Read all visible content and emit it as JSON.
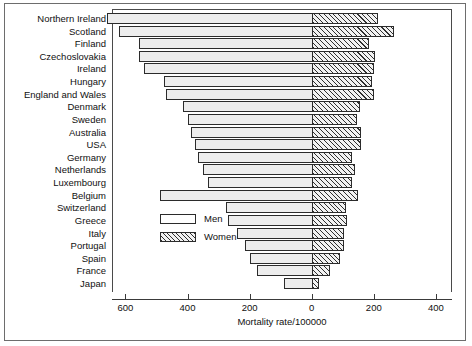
{
  "chart_data": {
    "type": "bar",
    "orientation": "horizontal",
    "style": "bidirectional-population-pyramid",
    "title": "",
    "xlabel": "Mortality rate/100000",
    "ylabel": "",
    "xlim": [
      -700,
      400
    ],
    "xticks": [
      600,
      400,
      200,
      0,
      200,
      400
    ],
    "xtick_labels": [
      "600",
      "400",
      "200",
      "0",
      "200",
      "400"
    ],
    "grid": false,
    "legend_position": "inside-center-left",
    "legend": [
      "Men",
      "Women"
    ],
    "note": "Men extend to the left of zero, Women to the right of zero.",
    "categories": [
      "Northern Ireland",
      "Scotland",
      "Finland",
      "Czechoslovakia",
      "Ireland",
      "Hungary",
      "England and Wales",
      "Denmark",
      "Sweden",
      "Australia",
      "USA",
      "Germany",
      "Netherlands",
      "Luxembourg",
      "Belgium",
      "Switzerland",
      "Greece",
      "Italy",
      "Portugal",
      "Spain",
      "France",
      "Japan"
    ],
    "series": [
      {
        "name": "Men",
        "values": [
          660,
          620,
          555,
          555,
          540,
          475,
          470,
          415,
          400,
          390,
          375,
          365,
          350,
          335,
          490,
          275,
          270,
          240,
          215,
          200,
          175,
          90
        ]
      },
      {
        "name": "Women",
        "values": [
          212,
          265,
          185,
          205,
          200,
          195,
          200,
          155,
          145,
          160,
          160,
          130,
          140,
          130,
          150,
          110,
          115,
          105,
          105,
          90,
          60,
          25
        ]
      }
    ]
  },
  "legend": {
    "men_label": "Men",
    "women_label": "Women"
  },
  "axis": {
    "title": "Mortality rate/100000",
    "tick_labels": [
      "600",
      "400",
      "200",
      "0",
      "200",
      "400"
    ]
  }
}
